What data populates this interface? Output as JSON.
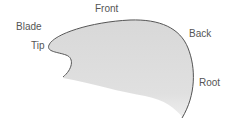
{
  "diagram": {
    "labels": {
      "front": "Front",
      "blade": "Blade",
      "tip": "Tip",
      "back": "Back",
      "root": "Root"
    },
    "colors": {
      "fill": "#dcdcdc",
      "outline": "#555555",
      "text": "#555555"
    }
  }
}
